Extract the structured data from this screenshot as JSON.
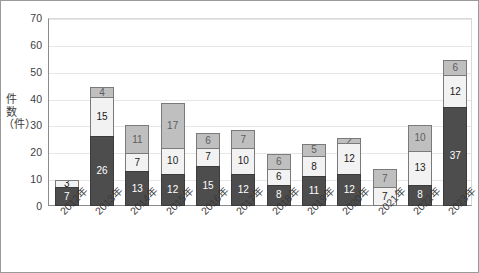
{
  "chart_data": {
    "type": "bar",
    "stacked": true,
    "title": "",
    "subtitle": "",
    "xlabel": "",
    "ylabel": "件数（件）",
    "ylim": [
      0,
      70
    ],
    "ytick_step": 10,
    "ytick_labels": [
      "0",
      "10",
      "20",
      "30",
      "40",
      "50",
      "60",
      "70"
    ],
    "grid": true,
    "legend": "none",
    "categories": [
      "2012年",
      "2013年",
      "2014年",
      "2015年",
      "2016年",
      "2017年",
      "2018年",
      "2019年",
      "2020年",
      "2021年",
      "2022年",
      "2023年"
    ],
    "series": [
      {
        "name": "series-1-dark",
        "color": "#4d4d4d",
        "values": [
          7,
          26,
          13,
          12,
          15,
          12,
          8,
          11,
          12,
          0,
          8,
          37
        ]
      },
      {
        "name": "series-2-white",
        "color": "#f2f2f2",
        "values": [
          3,
          15,
          7,
          10,
          7,
          10,
          6,
          8,
          12,
          7,
          13,
          12
        ]
      },
      {
        "name": "series-3-gray",
        "color": "#bfbfbf",
        "values": [
          0,
          4,
          11,
          17,
          6,
          7,
          6,
          5,
          2,
          7,
          10,
          6
        ]
      }
    ],
    "totals": [
      10,
      45,
      31,
      39,
      28,
      29,
      20,
      24,
      26,
      14,
      31,
      55
    ]
  },
  "axis": {
    "y_title": "件数（件）"
  }
}
